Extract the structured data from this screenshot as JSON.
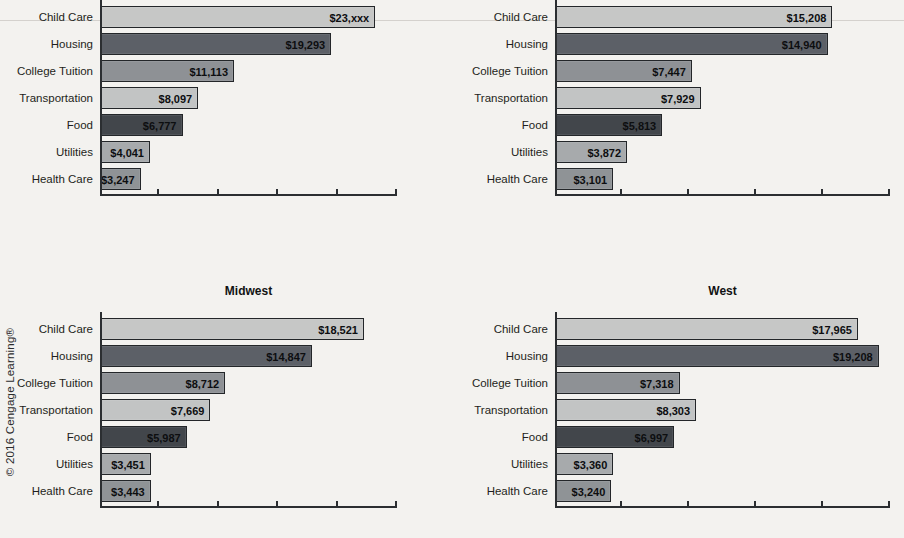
{
  "page": {
    "background": "#f3f2ef",
    "copyright": "© 2016 Cengage Learning®"
  },
  "chart_data": {
    "type": "bar",
    "orientation": "horizontal",
    "grid": false,
    "legend": "none",
    "tick_count": 5,
    "categories": [
      "Child Care",
      "Housing",
      "College Tuition",
      "Transportation",
      "Food",
      "Utilities",
      "Health Care"
    ],
    "bar_colors": [
      "#c6c7c6",
      "#5c6067",
      "#8e9195",
      "#c2c4c4",
      "#42464b",
      "#a7aaac",
      "#8f9396"
    ],
    "charts": [
      {
        "id": "top-left",
        "title": "",
        "values": [
          23000,
          19293,
          11113,
          8097,
          6777,
          4041,
          3247
        ],
        "value_labels": [
          "$23,xxx",
          "$19,293",
          "$11,113",
          "$8,097",
          "$6,777",
          "$4,041",
          "$3,247"
        ],
        "axis_max": 25000
      },
      {
        "id": "top-right",
        "title": "",
        "values": [
          15208,
          14940,
          7447,
          7929,
          5813,
          3872,
          3101
        ],
        "value_labels": [
          "$15,208",
          "$14,940",
          "$7,447",
          "$7,929",
          "$5,813",
          "$3,872",
          "$3,101"
        ],
        "axis_max": 18500
      },
      {
        "id": "bottom-left",
        "title": "Midwest",
        "values": [
          18521,
          14847,
          8712,
          7669,
          5987,
          3451,
          3443
        ],
        "value_labels": [
          "$18,521",
          "$14,847",
          "$8,712",
          "$7,669",
          "$5,987",
          "$3,451",
          "$3,443"
        ],
        "axis_max": 21000
      },
      {
        "id": "bottom-right",
        "title": "West",
        "values": [
          17965,
          19208,
          7318,
          8303,
          6997,
          3360,
          3240
        ],
        "value_labels": [
          "$17,965",
          "$19,208",
          "$7,318",
          "$8,303",
          "$6,997",
          "$3,360",
          "$3,240"
        ],
        "axis_max": 20000
      }
    ]
  }
}
